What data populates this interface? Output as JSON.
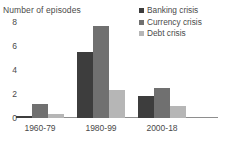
{
  "chart_data": {
    "type": "bar",
    "title": "",
    "ylabel": "Number of episodes",
    "xlabel": "",
    "categories": [
      "1960-79",
      "1980-99",
      "2000-18"
    ],
    "series": [
      {
        "name": "Banking crisis",
        "color": "#3d3d3d",
        "values": [
          0.15,
          5.5,
          1.8
        ]
      },
      {
        "name": "Currency crisis",
        "color": "#707070",
        "values": [
          1.2,
          7.7,
          2.5
        ]
      },
      {
        "name": "Debt crisis",
        "color": "#b6b6b6",
        "values": [
          0.3,
          2.3,
          1.0
        ]
      }
    ],
    "ylim": [
      0,
      8
    ],
    "yticks": [
      "8",
      "6",
      "4",
      "2",
      "0"
    ],
    "ytick_values": [
      8,
      6,
      4,
      2,
      0
    ],
    "grid": false,
    "legend_position": "top-right"
  }
}
